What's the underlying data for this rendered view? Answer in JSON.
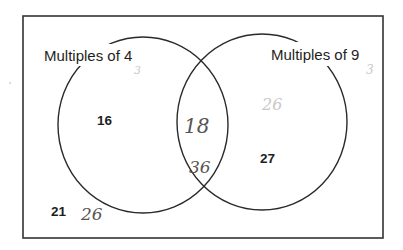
{
  "diagram": {
    "type": "venn",
    "universal_set": {
      "border_color": "#333333",
      "outside_values_printed": [
        "21"
      ],
      "outside_values_handwritten": [
        "26"
      ]
    },
    "sets": [
      {
        "label": "Multiples of 4",
        "handwritten_annotation": "3",
        "only_values_printed": [
          "16"
        ]
      },
      {
        "label": "Multiples of 9",
        "handwritten_annotation": "3",
        "only_values_printed": [
          "27"
        ],
        "only_values_handwritten_faint": [
          "26"
        ]
      }
    ],
    "intersection": {
      "values_handwritten": [
        "18",
        "36"
      ]
    }
  },
  "text": {
    "set_a_label": "Multiples of 4",
    "set_b_label": "Multiples of 9",
    "set_a_value": "16",
    "set_b_value": "27",
    "outside_value": "21",
    "outside_handwritten": "26",
    "intersection_1": "18",
    "intersection_2": "36",
    "set_b_faint": "26",
    "set_a_mark": "3",
    "set_b_mark": "3"
  },
  "colors": {
    "line": "#2a2a2a",
    "printed_text": "#1e1e1e",
    "handwriting": "#555555",
    "faint_handwriting": "#c8c8c8"
  }
}
